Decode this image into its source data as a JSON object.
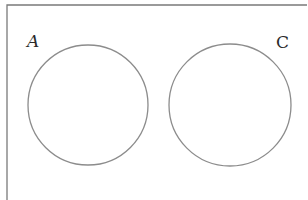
{
  "diagram": {
    "type": "venn",
    "universe_box": {
      "left": 7,
      "top": 5,
      "right": 307,
      "stroke": "#7a7a7a",
      "stroke_width": 1.3
    },
    "sets": [
      {
        "label": "A",
        "italic": true,
        "cx": 88,
        "cy": 105,
        "r": 60,
        "label_x": 27,
        "label_y": 47
      },
      {
        "label": "C",
        "italic": false,
        "cx": 230,
        "cy": 105,
        "r": 61,
        "label_x": 276,
        "label_y": 48
      }
    ],
    "circle_stroke": "#8c8c8c",
    "circle_stroke_width": 1.3,
    "overlap": false
  }
}
